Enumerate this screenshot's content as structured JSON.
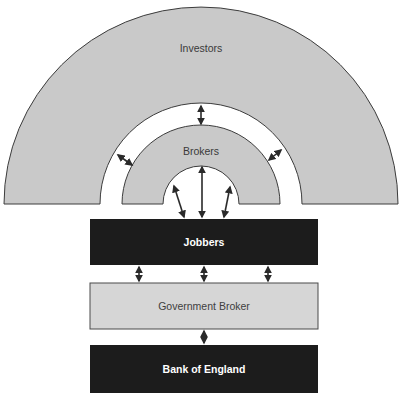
{
  "diagram": {
    "title": "",
    "colors": {
      "ring_fill": "#c9c9c9",
      "ring_stroke": "#3c3c3c",
      "dark_box_fill": "#1c1c1c",
      "gov_box_fill": "#d6d6d6",
      "arrow": "#2a2a2a",
      "background": "#ffffff"
    },
    "nodes": {
      "investors": {
        "label": "Investors",
        "shape": "half-ring"
      },
      "brokers": {
        "label": "Brokers",
        "shape": "half-ring"
      },
      "jobbers": {
        "label": "Jobbers",
        "shape": "box"
      },
      "government_broker": {
        "label": "Government Broker",
        "shape": "box"
      },
      "bank_of_england": {
        "label": "Bank of England",
        "shape": "box"
      }
    },
    "edges": [
      {
        "from": "investors",
        "to": "brokers",
        "type": "double-arrow",
        "count": 3
      },
      {
        "from": "brokers",
        "to": "jobbers",
        "type": "double-arrow",
        "count": 3
      },
      {
        "from": "jobbers",
        "to": "government_broker",
        "type": "double-arrow",
        "count": 3
      },
      {
        "from": "government_broker",
        "to": "bank_of_england",
        "type": "double-arrow",
        "count": 1
      }
    ]
  }
}
